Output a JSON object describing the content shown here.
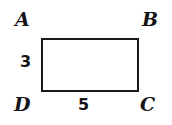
{
  "figure": {
    "type": "rectangle",
    "background_color": "#ffffff",
    "stroke_color": "#1a1a1a",
    "fill_color": "#ffffff",
    "vertices": [
      {
        "id": "a",
        "label": "A",
        "position": "top-left"
      },
      {
        "id": "b",
        "label": "B",
        "position": "top-right"
      },
      {
        "id": "c",
        "label": "C",
        "position": "bottom-right"
      },
      {
        "id": "d",
        "label": "D",
        "position": "bottom-left"
      }
    ],
    "measurements": [
      {
        "id": "height",
        "label": "3",
        "side": "left",
        "side_endpoints": "AD"
      },
      {
        "id": "width",
        "label": "5",
        "side": "bottom",
        "side_endpoints": "DC"
      }
    ]
  }
}
